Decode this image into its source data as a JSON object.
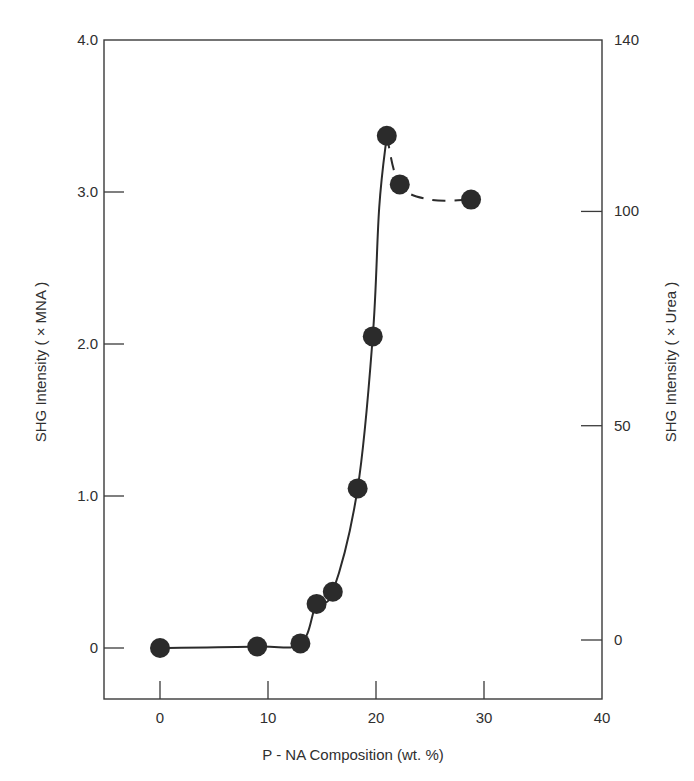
{
  "chart_data": {
    "type": "scatter",
    "title": "",
    "xlabel": "P - NA Composition (wt. %)",
    "ylabel": "SHG Intensity ( × MNA )",
    "ylabel_right": "SHG Intensity ( × Urea )",
    "xlim": [
      -5.2,
      40
    ],
    "ylim": [
      -0.34,
      4.0
    ],
    "ylim_right": [
      -7.8,
      140
    ],
    "grid": false,
    "legend": null,
    "x_ticks": [
      "0",
      "10",
      "20",
      "30",
      "40"
    ],
    "x_tick_values": [
      0,
      10,
      20,
      30,
      40
    ],
    "y_ticks": [
      "0",
      "1.0",
      "2.0",
      "3.0",
      "4.0"
    ],
    "y_tick_values": [
      0,
      1,
      2,
      3,
      4
    ],
    "y_right_ticks": [
      "0",
      "50",
      "100",
      "140"
    ],
    "y_right_tick_values": [
      0,
      50,
      100,
      140
    ],
    "series": [
      {
        "name": "SHG intensity",
        "marker": "filled-circle",
        "color": "#2b2b2b",
        "x": [
          0,
          9,
          13,
          14.5,
          16,
          18.3,
          19.7,
          21,
          22.2,
          28.8
        ],
        "y": [
          0,
          0.01,
          0.03,
          0.29,
          0.37,
          1.05,
          2.05,
          3.37,
          3.05,
          2.95
        ]
      }
    ],
    "curves": [
      {
        "name": "solid-fit",
        "style": "solid",
        "x": [
          0,
          9,
          13,
          14.5,
          16,
          18.3,
          19.7,
          20.3,
          21
        ],
        "y": [
          0,
          0.01,
          0.03,
          0.29,
          0.37,
          1.05,
          2.05,
          2.9,
          3.37
        ]
      },
      {
        "name": "dashed-fit",
        "style": "dashed",
        "x": [
          21,
          22.2,
          25,
          28.8
        ],
        "y": [
          3.37,
          3.05,
          2.95,
          2.95
        ]
      }
    ]
  },
  "colors": {
    "ink": "#2b2b2b",
    "axis": "#3a3a3a",
    "background": "#ffffff"
  }
}
